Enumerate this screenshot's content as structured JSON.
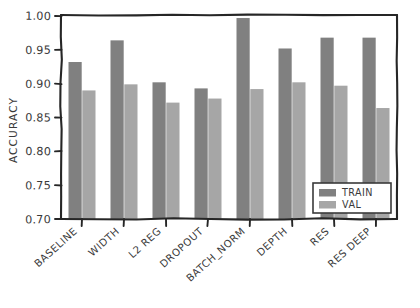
{
  "chart_data": {
    "type": "bar",
    "title": "",
    "subtitle": "",
    "xlabel": "",
    "ylabel": "ACCURACY",
    "ylim": [
      0.7,
      1.0
    ],
    "yticks": [
      "0.70",
      "0.75",
      "0.80",
      "0.85",
      "0.90",
      "0.95",
      "1.00"
    ],
    "ytick_values": [
      0.7,
      0.75,
      0.8,
      0.85,
      0.9,
      0.95,
      1.0
    ],
    "grid": false,
    "legend_position": "lower right",
    "style": "hand-drawn",
    "categories": [
      "BASELINE",
      "WIDTH",
      "L2 REG",
      "DROPOUT",
      "BATCH_NORM",
      "DEPTH",
      "RES",
      "RES DEEP"
    ],
    "series": [
      {
        "name": "TRAIN",
        "color": "#808080",
        "values": [
          0.932,
          0.964,
          0.902,
          0.893,
          0.997,
          0.952,
          0.968,
          0.968
        ]
      },
      {
        "name": "VAL",
        "color": "#a6a6a6",
        "values": [
          0.89,
          0.899,
          0.872,
          0.878,
          0.892,
          0.902,
          0.897,
          0.864
        ]
      }
    ]
  },
  "axes": {
    "frame_color": "#262626",
    "text_color": "#3a3a3a"
  },
  "legend": {
    "entries": [
      "TRAIN",
      "VAL"
    ]
  }
}
